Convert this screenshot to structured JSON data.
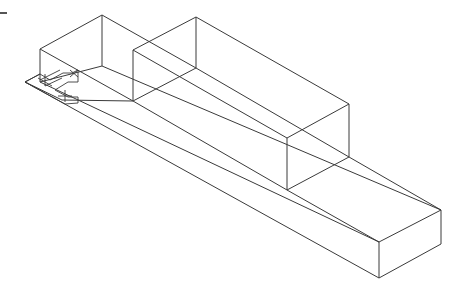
{
  "drawing": {
    "type": "isometric-wireframe",
    "stroke_color": "#3a3a3a",
    "background": "#ffffff",
    "marker": "cursor-tick",
    "solids": [
      {
        "name": "back-box",
        "edges": [
          [
            40,
            49,
            102,
            15
          ],
          [
            102,
            15,
            196,
            68
          ],
          [
            40,
            49,
            40,
            82
          ],
          [
            102,
            15,
            102,
            66
          ],
          [
            40,
            82,
            102,
            66
          ],
          [
            40,
            49,
            133,
            101
          ]
        ]
      },
      {
        "name": "middle-box",
        "edges": [
          [
            133,
            50,
            196,
            17
          ],
          [
            196,
            17,
            349,
            104
          ],
          [
            133,
            50,
            287,
            138
          ],
          [
            287,
            138,
            349,
            104
          ],
          [
            133,
            50,
            133,
            101
          ],
          [
            196,
            17,
            196,
            68
          ],
          [
            287,
            138,
            287,
            190
          ],
          [
            349,
            104,
            349,
            157
          ],
          [
            133,
            101,
            196,
            68
          ],
          [
            287,
            190,
            349,
            157
          ],
          [
            133,
            101,
            287,
            190
          ],
          [
            196,
            68,
            349,
            157
          ]
        ]
      },
      {
        "name": "base-slab",
        "edges": [
          [
            25,
            82,
            40,
            74
          ],
          [
            25,
            82,
            379,
            278
          ],
          [
            379,
            278,
            441,
            244
          ],
          [
            441,
            210,
            441,
            244
          ],
          [
            379,
            242,
            441,
            210
          ],
          [
            379,
            242,
            379,
            278
          ],
          [
            287,
            190,
            379,
            242
          ],
          [
            349,
            157,
            441,
            210
          ],
          [
            40,
            82,
            379,
            242
          ],
          [
            102,
            66,
            441,
            210
          ],
          [
            62,
            100,
            133,
            101
          ],
          [
            25,
            82,
            62,
            100
          ]
        ]
      }
    ],
    "ucs_icon": {
      "paths": [
        "M25,82 L40,74 L50,80 L63,73 L72,73 L78,70 L78,82 L68,82 L55,90 L68,97 L78,97 L78,103 L65,104 Z",
        "M70,70 L78,77 M70,77 L78,70",
        "M38,78 L52,86 M45,74 L45,86",
        "M58,96 L72,96 M65,90 L65,102",
        "M40,80 L60,70 M45,86 L62,78"
      ]
    }
  }
}
